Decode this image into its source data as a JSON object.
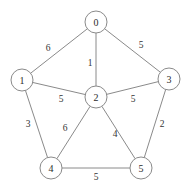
{
  "chart_data": {
    "type": "diagram",
    "title": "",
    "graph_kind": "undirected weighted graph",
    "background_color": "#ffffff",
    "edge_color": "#8a8a8a",
    "node_fill": "#ffffff",
    "node_stroke": "#8a8a8a",
    "label_color": "#2b2b2b",
    "node_radius": 11,
    "nodes": [
      {
        "id": "0",
        "label": "0",
        "x": 96,
        "y": 22
      },
      {
        "id": "1",
        "label": "1",
        "x": 22,
        "y": 80
      },
      {
        "id": "2",
        "label": "2",
        "x": 96,
        "y": 97
      },
      {
        "id": "3",
        "label": "3",
        "x": 169,
        "y": 79
      },
      {
        "id": "4",
        "label": "4",
        "x": 51,
        "y": 168
      },
      {
        "id": "5",
        "label": "5",
        "x": 141,
        "y": 168
      }
    ],
    "edges": [
      {
        "from": "0",
        "to": "1",
        "weight": "6",
        "lx": 48,
        "ly": 48
      },
      {
        "from": "0",
        "to": "2",
        "weight": "1",
        "lx": 90,
        "ly": 63
      },
      {
        "from": "0",
        "to": "3",
        "weight": "5",
        "lx": 141,
        "ly": 45
      },
      {
        "from": "1",
        "to": "2",
        "weight": "5",
        "lx": 61,
        "ly": 99
      },
      {
        "from": "1",
        "to": "4",
        "weight": "3",
        "lx": 28,
        "ly": 124
      },
      {
        "from": "2",
        "to": "3",
        "weight": "5",
        "lx": 133,
        "ly": 99
      },
      {
        "from": "2",
        "to": "4",
        "weight": "6",
        "lx": 65,
        "ly": 128
      },
      {
        "from": "2",
        "to": "5",
        "weight": "4",
        "lx": 115,
        "ly": 134
      },
      {
        "from": "3",
        "to": "5",
        "weight": "2",
        "lx": 162,
        "ly": 124
      },
      {
        "from": "4",
        "to": "5",
        "weight": "5",
        "lx": 96,
        "ly": 177
      }
    ]
  }
}
